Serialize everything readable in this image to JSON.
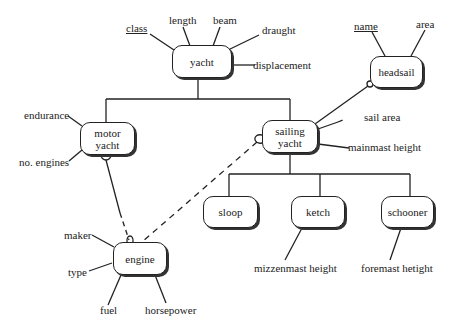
{
  "diagram": {
    "type": "entity-relationship",
    "entities": {
      "yacht": {
        "label": "yacht",
        "attributes": [
          "class",
          "length",
          "beam",
          "draught",
          "displacement"
        ],
        "key": "class"
      },
      "headsail": {
        "label": "headsail",
        "attributes": [
          "name",
          "area"
        ],
        "key": "name"
      },
      "motor_yacht": {
        "label_line1": "motor",
        "label_line2": "yacht",
        "attributes": [
          "endurance",
          "no. engines"
        ]
      },
      "sailing_yacht": {
        "label_line1": "sailing",
        "label_line2": "yacht",
        "attributes": [
          "sail area",
          "mainmast height"
        ]
      },
      "sloop": {
        "label": "sloop",
        "attributes": []
      },
      "ketch": {
        "label": "ketch",
        "attributes": [
          "mizzenmast height"
        ]
      },
      "schooner": {
        "label": "schooner",
        "attributes": [
          "foremast hetight"
        ]
      },
      "engine": {
        "label": "engine",
        "attributes": [
          "maker",
          "type",
          "fuel",
          "horsepower"
        ]
      }
    },
    "attribute_labels": {
      "class": "class",
      "length": "length",
      "beam": "beam",
      "draught": "draught",
      "displacement": "displacement",
      "name": "name",
      "area": "area",
      "endurance": "endurance",
      "no_engines": "no. engines",
      "sail_area": "sail area",
      "mainmast_height": "mainmast height",
      "mizzenmast_height": "mizzenmast height",
      "foremast_height": "foremast hetight",
      "maker": "maker",
      "type": "type",
      "fuel": "fuel",
      "horsepower": "horsepower"
    },
    "relationships": [
      {
        "from": "yacht",
        "to": "motor yacht",
        "kind": "subtype"
      },
      {
        "from": "yacht",
        "to": "sailing yacht",
        "kind": "subtype"
      },
      {
        "from": "sailing yacht",
        "to": "sloop",
        "kind": "subtype"
      },
      {
        "from": "sailing yacht",
        "to": "ketch",
        "kind": "subtype"
      },
      {
        "from": "sailing yacht",
        "to": "schooner",
        "kind": "subtype"
      },
      {
        "from": "sailing yacht",
        "to": "headsail",
        "kind": "association",
        "optional_end": "headsail"
      },
      {
        "from": "motor yacht",
        "to": "engine",
        "kind": "association",
        "optional_end": "motor yacht / engine",
        "style": "solid-then-dashed"
      },
      {
        "from": "sailing yacht",
        "to": "engine",
        "kind": "association",
        "optional_end": "sailing yacht",
        "style": "dashed"
      }
    ],
    "colors": {
      "line": "#222222",
      "background": "#ffffff",
      "shadow": "#333333"
    }
  }
}
